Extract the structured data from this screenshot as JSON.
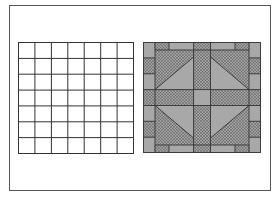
{
  "figure": {
    "grid_size": 7,
    "colors": {
      "line": "#333333",
      "solid": "#a8a8a8",
      "dotted_bg": "#9a9a9a",
      "dot": "#5a5a5a",
      "background": "#ffffff"
    },
    "left_panel": {
      "label": "blank grid"
    },
    "right_panel": {
      "label": "quilt block pattern"
    }
  }
}
